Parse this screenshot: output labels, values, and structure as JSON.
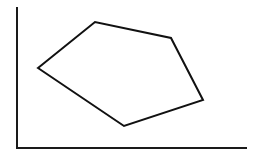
{
  "figure": {
    "title": "",
    "background_color": "#ffffff",
    "width": 258,
    "height": 156,
    "caption": ""
  },
  "axes": {
    "name": "l-shaped-axes",
    "stroke_color": "#1a1a1a",
    "stroke_width": 2,
    "y_axis": {
      "x1": 17,
      "y1": 8,
      "x2": 17,
      "y2": 148,
      "label": "",
      "ticks": []
    },
    "x_axis": {
      "x1": 17,
      "y1": 148,
      "x2": 246,
      "y2": 148,
      "label": "",
      "ticks": []
    }
  },
  "chart_data": {
    "type": "scatter",
    "title": "",
    "xlabel": "",
    "ylabel": "",
    "grid": false,
    "legend_position": "none",
    "xlim": [
      17,
      246
    ],
    "ylim": [
      148,
      8
    ],
    "shapes": [
      {
        "name": "hexagon-outline",
        "kind": "polygon",
        "closed": true,
        "fill": "none",
        "stroke": "#111111",
        "stroke_width": 2,
        "vertex_count": 5,
        "vertices": [
          {
            "label": "left",
            "x": 38,
            "y": 68
          },
          {
            "label": "top",
            "x": 95,
            "y": 22
          },
          {
            "label": "upper-right",
            "x": 171,
            "y": 38
          },
          {
            "label": "lower-right",
            "x": 203,
            "y": 100
          },
          {
            "label": "bottom",
            "x": 124,
            "y": 126
          }
        ]
      }
    ],
    "annotations": []
  }
}
